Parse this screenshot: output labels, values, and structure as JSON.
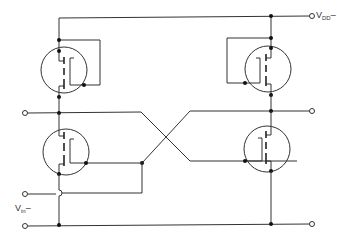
{
  "diagram": {
    "type": "circuit-schematic",
    "labels": {
      "vdd_main": "V",
      "vdd_sub": "DD",
      "vdd_suffix": "–",
      "vin_main": "V",
      "vin_sub": "in",
      "vin_suffix": "–"
    },
    "components": [
      {
        "id": "Q1",
        "kind": "mosfet",
        "position": "upper-left",
        "role": "load"
      },
      {
        "id": "Q2",
        "kind": "mosfet",
        "position": "upper-right",
        "role": "load"
      },
      {
        "id": "Q3",
        "kind": "mosfet",
        "position": "lower-left",
        "role": "switch"
      },
      {
        "id": "Q4",
        "kind": "mosfet",
        "position": "lower-right",
        "role": "switch"
      }
    ],
    "terminals": [
      "VDD",
      "left-output",
      "right-output",
      "Vin",
      "ground-left",
      "ground-right"
    ],
    "colors": {
      "line": "#333333",
      "background": "#ffffff"
    }
  }
}
